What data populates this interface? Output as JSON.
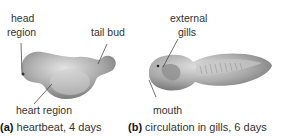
{
  "panel_a": {
    "labels": {
      "head": "head",
      "region": "region",
      "tail_bud": "tail bud",
      "heart_region": "heart region"
    },
    "caption_letter": "(a)",
    "caption_text": " heartbeat, 4 days"
  },
  "panel_b": {
    "labels": {
      "external": "external",
      "gills": "gills",
      "mouth": "mouth"
    },
    "caption_letter": "(b)",
    "caption_text": " circulation in gills, 6 days"
  },
  "colors": {
    "embryo_fill": "#a8a8a8",
    "embryo_highlight": "#d8d8d8",
    "embryo_shadow": "#7a7a7a",
    "label_text": "#333333",
    "leader_line": "#333333"
  }
}
